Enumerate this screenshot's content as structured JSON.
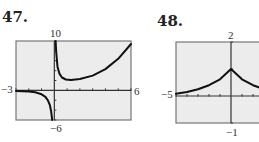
{
  "chart_data": [
    {
      "type": "line",
      "problem_number": "47.",
      "title": "",
      "xlim": [
        -3,
        6
      ],
      "ylim": [
        -6,
        10
      ],
      "window_labels": {
        "xmin": "−3",
        "xmax": "6",
        "ymin": "−6",
        "ymax": "10"
      },
      "x_tick_step": 1,
      "y_tick_step": 2,
      "grid": false,
      "description": "Curve with vertical asymptote at x=0; left branch near 0 dropping to -infinity as x→0-, right branch descending from +infinity to a minimum near (1.2, 2) then rising",
      "series": [
        {
          "name": "left-branch",
          "x": [
            -3,
            -2,
            -1.5,
            -1,
            -0.7,
            -0.5,
            -0.35,
            -0.25,
            -0.17
          ],
          "y": [
            -0.1,
            -0.2,
            -0.4,
            -0.8,
            -1.3,
            -2,
            -3,
            -4.2,
            -6
          ]
        },
        {
          "name": "right-branch",
          "x": [
            0.1,
            0.15,
            0.25,
            0.4,
            0.6,
            0.9,
            1.3,
            2,
            3,
            4,
            5,
            6
          ],
          "y": [
            10,
            7.5,
            4.8,
            3.4,
            2.6,
            2.2,
            2.1,
            2.3,
            3.0,
            4.3,
            6.4,
            9.4
          ]
        }
      ]
    },
    {
      "type": "line",
      "problem_number": "48.",
      "title": "",
      "xlim": [
        -5,
        5
      ],
      "ylim": [
        -1,
        2
      ],
      "window_labels": {
        "xmin": "−5",
        "ymin": "−1",
        "ymax": "2"
      },
      "x_tick_step": 1,
      "y_tick_step": 1,
      "grid": false,
      "description": "Symmetric cusp-shaped curve with peak at (0, 1), decaying toward y≈0 as |x| grows (right part cropped)",
      "series": [
        {
          "name": "curve",
          "x": [
            -5,
            -4,
            -3,
            -2,
            -1,
            0,
            1,
            2,
            3,
            4,
            5
          ],
          "y": [
            0.08,
            0.15,
            0.25,
            0.4,
            0.62,
            1,
            0.62,
            0.4,
            0.25,
            0.15,
            0.08
          ]
        }
      ]
    }
  ]
}
